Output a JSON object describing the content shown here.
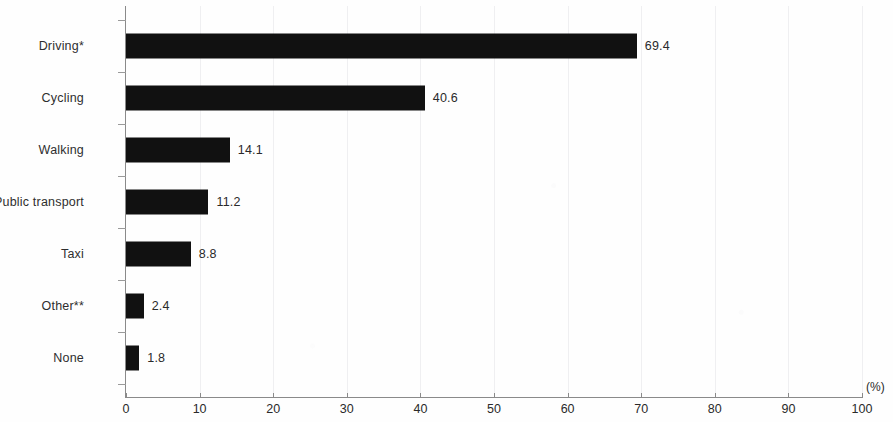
{
  "chart_data": {
    "type": "bar",
    "orientation": "horizontal",
    "title": "",
    "subtitle": "",
    "xlabel": "(%)",
    "ylabel": "",
    "categories": [
      "Driving*",
      "Cycling",
      "Walking",
      "Public transport",
      "Taxi",
      "Other**",
      "None"
    ],
    "values": [
      69.4,
      40.6,
      14.1,
      11.2,
      8.8,
      2.4,
      1.8
    ],
    "data_labels": [
      "69.4",
      "40.6",
      "14.1",
      "11.2",
      "8.8",
      "2.4",
      "1.8"
    ],
    "xlim": [
      0,
      100
    ],
    "xticks": [
      0,
      10,
      20,
      30,
      40,
      50,
      60,
      70,
      80,
      90,
      100
    ],
    "xtick_labels": [
      "0",
      "10",
      "20",
      "30",
      "40",
      "50",
      "60",
      "70",
      "80",
      "90",
      "100"
    ],
    "grid": "faint-vertical",
    "legend": "none",
    "bar_color": "#111111",
    "axis_color": "#8a8a8a",
    "background_color": "#fefefe"
  },
  "axis": {
    "unit_label": "(%)"
  }
}
